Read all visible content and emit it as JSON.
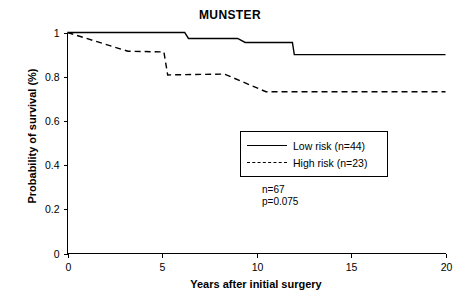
{
  "chart_data": {
    "type": "line",
    "title": "MUNSTER",
    "xlabel": "Years after initial surgery",
    "ylabel": "Probability of survival (%)",
    "xlim": [
      0,
      20
    ],
    "ylim": [
      0,
      1
    ],
    "xticks": [
      0,
      5,
      10,
      15,
      20
    ],
    "xtick_labels": [
      "0",
      "5",
      "10",
      "15",
      "20"
    ],
    "yticks": [
      0,
      0.2,
      0.4,
      0.6,
      0.8,
      1
    ],
    "ytick_labels": [
      "0",
      "0.2",
      "0.4",
      "0.6",
      "0.8",
      "1"
    ],
    "grid": false,
    "legend_position": "center-right",
    "series": [
      {
        "name": "Low risk (n=44)",
        "style": "solid",
        "color": "#000000",
        "points": [
          [
            0,
            1.0
          ],
          [
            6.2,
            1.0
          ],
          [
            6.4,
            0.973
          ],
          [
            9.0,
            0.973
          ],
          [
            9.4,
            0.955
          ],
          [
            11.9,
            0.955
          ],
          [
            12.0,
            0.9
          ],
          [
            20,
            0.9
          ]
        ]
      },
      {
        "name": "High risk (n=23)",
        "style": "dashed",
        "color": "#000000",
        "points": [
          [
            0,
            1.0
          ],
          [
            3.2,
            0.915
          ],
          [
            3.3,
            0.915
          ],
          [
            5.1,
            0.912
          ],
          [
            5.3,
            0.808
          ],
          [
            8.3,
            0.812
          ],
          [
            10.5,
            0.732
          ],
          [
            20,
            0.732
          ]
        ]
      }
    ],
    "annotations": [
      {
        "text": "n=67"
      },
      {
        "text": "p=0.075"
      }
    ]
  },
  "legend": {
    "items": [
      {
        "label": "Low risk (n=44)",
        "style": "solid"
      },
      {
        "label": "High risk (n=23)",
        "style": "dashed"
      }
    ]
  },
  "annotation": {
    "sample_size": "n=67",
    "p_value": "p=0.075"
  }
}
